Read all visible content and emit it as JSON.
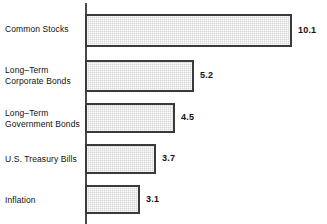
{
  "chart_data": {
    "type": "bar",
    "orientation": "horizontal",
    "title": "",
    "subtitle": "",
    "xlabel": "",
    "ylabel": "",
    "grid": false,
    "legend": null,
    "axis": {
      "category_axis": "vertical-left",
      "value_axis_visible": false,
      "tick_labels": []
    },
    "categories": [
      "Common Stocks",
      "Long–Term\nCorporate Bonds",
      "Long–Term\nGovernment Bonds",
      "U.S. Treasury Bills",
      "Inflation"
    ],
    "values": [
      10.1,
      5.2,
      4.5,
      3.7,
      3.1
    ],
    "value_labels": [
      "10.1",
      "5.2",
      "4.5",
      "3.7",
      "3.1"
    ],
    "colors": {
      "bar_fill": "#d7d7d7",
      "bar_border": "#3a3a3a",
      "axis": "#4a4a4a",
      "text": "#111111",
      "background": "#ffffff"
    },
    "bars": [
      {
        "category": "Common Stocks",
        "value": 10.1,
        "value_label": "10.1",
        "top": 14,
        "height": 33,
        "width": 207,
        "label_top": 24
      },
      {
        "category": "Long–Term\nCorporate Bonds",
        "value": 5.2,
        "value_label": "5.2",
        "top": 60,
        "height": 32,
        "width": 109,
        "label_top": 65
      },
      {
        "category": "Long–Term\nGovernment Bonds",
        "value": 4.5,
        "value_label": "4.5",
        "top": 103,
        "height": 30,
        "width": 90,
        "label_top": 108
      },
      {
        "category": "U.S. Treasury Bills",
        "value": 3.7,
        "value_label": "3.7",
        "top": 144,
        "height": 30,
        "width": 71,
        "label_top": 154
      },
      {
        "category": "Inflation",
        "value": 3.1,
        "value_label": "3.1",
        "top": 185,
        "height": 29,
        "width": 55,
        "label_top": 195
      }
    ]
  }
}
